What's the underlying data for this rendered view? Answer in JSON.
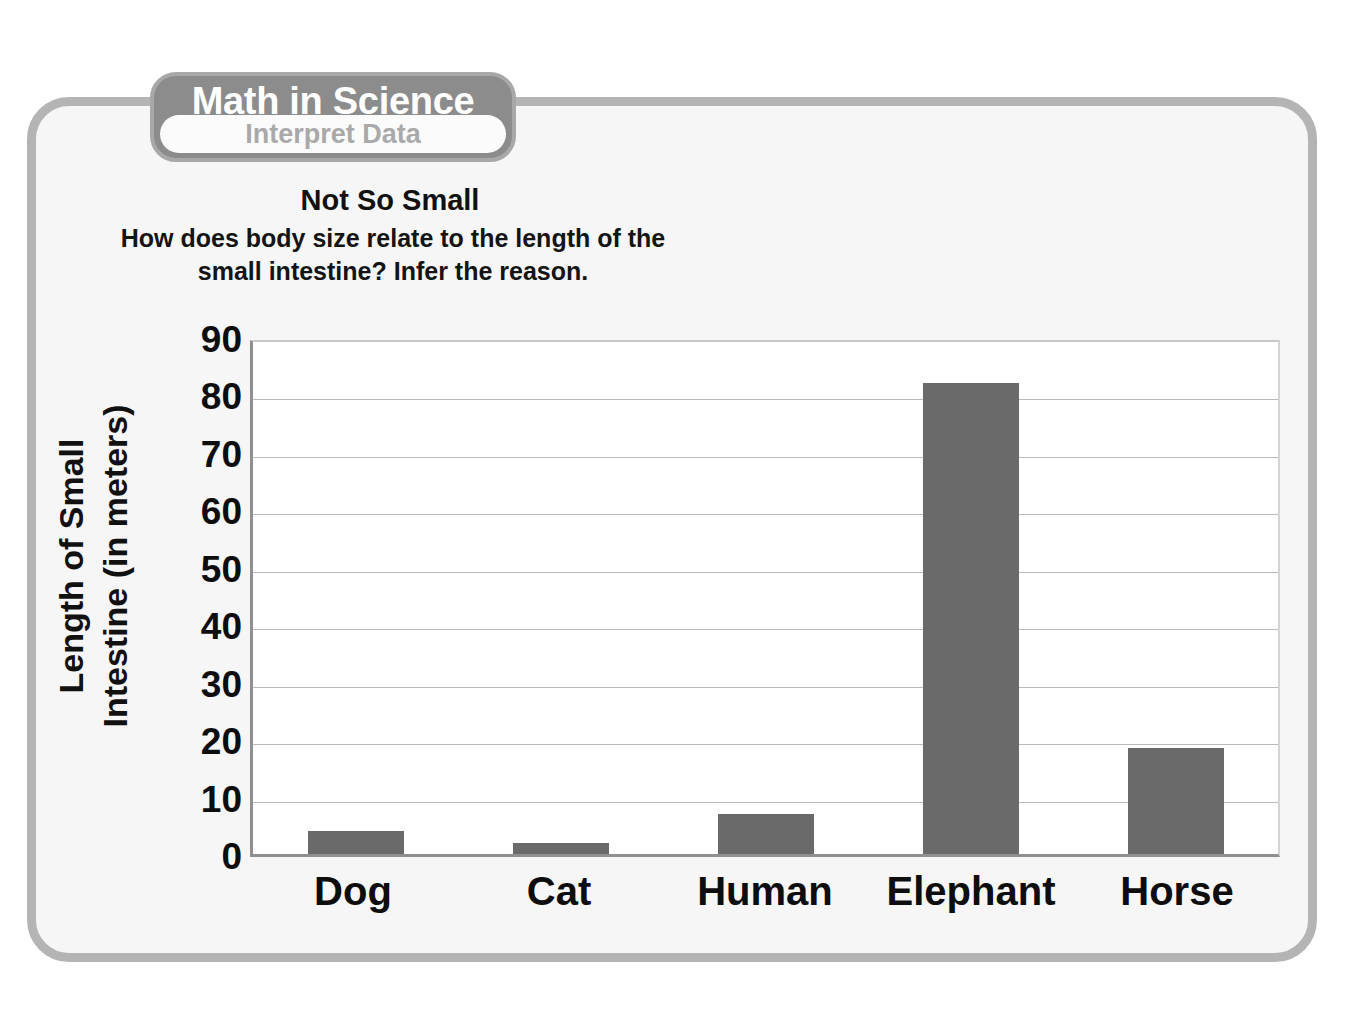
{
  "badge": {
    "title": "Math in Science",
    "subtitle": "Interpret Data"
  },
  "activity": {
    "title": "Not So Small",
    "question_part1": "How does body size relate to the length of the small intestine? ",
    "question_emphasis": "Infer",
    "question_part2": " the reason."
  },
  "colors": {
    "bar": "#6a6a6a",
    "frame": "#b4b4b4",
    "badge": "#8c8c8c",
    "gridline": "#b9b9b9",
    "axis": "#8f8f8f"
  },
  "chart_data": {
    "type": "bar",
    "title": "Not So Small",
    "categories": [
      "Dog",
      "Cat",
      "Human",
      "Elephant",
      "Horse"
    ],
    "values": [
      4,
      2,
      7,
      82,
      18.5
    ],
    "xlabel": "",
    "ylabel_lines": [
      "Length of Small",
      "Intestine (in meters)"
    ],
    "ylabel": "Length of Small Intestine (in meters)",
    "ylim": [
      0,
      90
    ],
    "yticks": [
      90,
      80,
      70,
      60,
      50,
      40,
      30,
      20,
      10,
      0
    ],
    "ytick_labels": [
      "90",
      "80",
      "70",
      "60",
      "50",
      "40",
      "30",
      "20",
      "10",
      "0"
    ],
    "grid": true,
    "legend": false,
    "units": "meters",
    "bar_color": "#6a6a6a"
  }
}
